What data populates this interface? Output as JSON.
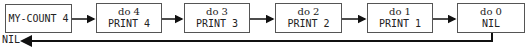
{
  "diagram": {
    "start_node": {
      "label": "MY-COUNT 4"
    },
    "nodes": [
      {
        "line1": "do 4",
        "line2": "PRINT 4"
      },
      {
        "line1": "do 3",
        "line2": "PRINT 3"
      },
      {
        "line1": "do 2",
        "line2": "PRINT 2"
      },
      {
        "line1": "do 1",
        "line2": "PRINT 1"
      },
      {
        "line1": "do 0",
        "line2": "NIL"
      }
    ],
    "return_label": "NIL"
  }
}
